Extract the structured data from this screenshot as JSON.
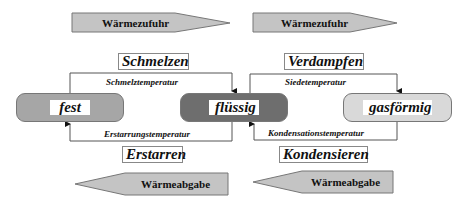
{
  "heat_arrows": {
    "supply_left": {
      "label": "Wärmezufuhr",
      "direction": "right"
    },
    "supply_right": {
      "label": "Wärmezufuhr",
      "direction": "right"
    },
    "release_left": {
      "label": "Wärmeabgabe",
      "direction": "left"
    },
    "release_right": {
      "label": "Wärmeabgabe",
      "direction": "left"
    }
  },
  "processes": {
    "melting": "Schmelzen",
    "evaporating": "Verdampfen",
    "solidifying": "Erstarren",
    "condensing": "Kondensieren"
  },
  "temperatures": {
    "melting_point": "Schmelztemperatur",
    "boiling_point": "Siedetemperatur",
    "freezing_point": "Erstarrungstemperatur",
    "condensation_point": "Kondensationstemperatur"
  },
  "states": [
    {
      "id": "solid",
      "label": "fest",
      "color": "#a6a6a6"
    },
    {
      "id": "liquid",
      "label": "flüssig",
      "color": "#6e6e6e"
    },
    {
      "id": "gas",
      "label": "gasförmig",
      "color": "#d9d9d9"
    }
  ],
  "colors": {
    "arrow_fill": "#c4c4c4",
    "arrow_stroke": "#777777",
    "line": "#555555"
  }
}
